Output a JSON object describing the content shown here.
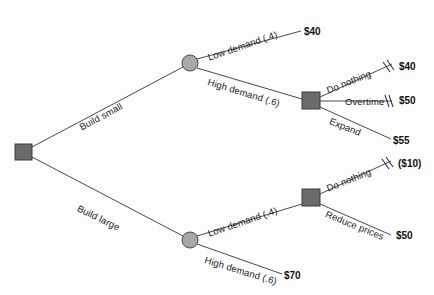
{
  "diagram": {
    "type": "decision-tree",
    "title": "",
    "colors": {
      "decision_node": "#6b6b6b",
      "chance_node": "#a8a8a8",
      "line": "#4a4a4a",
      "text": "#111111",
      "background": "#fdfdfd"
    },
    "nodes": [
      {
        "id": "root",
        "kind": "decision",
        "shape": "square",
        "x": 23,
        "y": 152
      },
      {
        "id": "chance_small",
        "kind": "chance",
        "shape": "circle",
        "x": 190,
        "y": 63
      },
      {
        "id": "decision_small_high",
        "kind": "decision",
        "shape": "square",
        "x": 311,
        "y": 101
      },
      {
        "id": "chance_large",
        "kind": "chance",
        "shape": "circle",
        "x": 190,
        "y": 240
      },
      {
        "id": "decision_large_low",
        "kind": "decision",
        "shape": "square",
        "x": 311,
        "y": 198
      }
    ],
    "branches": [
      {
        "id": "build-small",
        "label": "Build small",
        "from": "root",
        "to": "chance_small",
        "pruned": false
      },
      {
        "id": "build-large",
        "label": "Build large",
        "from": "root",
        "to": "chance_large",
        "pruned": false
      },
      {
        "id": "small-low-demand",
        "label": "Low demand (.4)",
        "from": "chance_small",
        "to": "payoff-40-a",
        "pruned": false
      },
      {
        "id": "small-high-demand",
        "label": "High demand (.6)",
        "from": "chance_small",
        "to": "decision_small_high",
        "pruned": false
      },
      {
        "id": "small-do-nothing",
        "label": "Do nothing",
        "from": "decision_small_high",
        "to": "payoff-40-b",
        "pruned": true
      },
      {
        "id": "small-overtime",
        "label": "Overtime",
        "from": "decision_small_high",
        "to": "payoff-50-a",
        "pruned": true
      },
      {
        "id": "small-expand",
        "label": "Expand",
        "from": "decision_small_high",
        "to": "payoff-55",
        "pruned": false
      },
      {
        "id": "large-low-demand",
        "label": "Low demand (.4)",
        "from": "chance_large",
        "to": "decision_large_low",
        "pruned": false
      },
      {
        "id": "large-high-demand",
        "label": "High demand (.6)",
        "from": "chance_large",
        "to": "payoff-70",
        "pruned": false
      },
      {
        "id": "large-do-nothing",
        "label": "Do nothing",
        "from": "decision_large_low",
        "to": "payoff-neg10",
        "pruned": true
      },
      {
        "id": "large-reduce-prices",
        "label": "Reduce prices",
        "from": "decision_large_low",
        "to": "payoff-50-b",
        "pruned": false
      }
    ],
    "payoffs": [
      {
        "id": "payoff-40-a",
        "value": "$40",
        "x": 304,
        "y": 26,
        "pruned": false
      },
      {
        "id": "payoff-40-b",
        "value": "$40",
        "x": 399,
        "y": 61,
        "pruned": true
      },
      {
        "id": "payoff-50-a",
        "value": "$50",
        "x": 399,
        "y": 95,
        "pruned": true
      },
      {
        "id": "payoff-55",
        "value": "$55",
        "x": 393,
        "y": 135,
        "pruned": false
      },
      {
        "id": "payoff-neg10",
        "value": "($10)",
        "x": 398,
        "y": 158,
        "pruned": true
      },
      {
        "id": "payoff-50-b",
        "value": "$50",
        "x": 396,
        "y": 230,
        "pruned": false
      },
      {
        "id": "payoff-70",
        "value": "$70",
        "x": 284,
        "y": 270,
        "pruned": false
      }
    ],
    "edge_labels": [
      {
        "id": "build-small",
        "text": "Build small",
        "x": 80,
        "y": 122,
        "rotate": -28
      },
      {
        "id": "build-large",
        "text": "Build large",
        "x": 78,
        "y": 202,
        "rotate": 26
      },
      {
        "id": "small-low-demand",
        "text": "Low demand (.4)",
        "x": 208,
        "y": 52,
        "rotate": -19
      },
      {
        "id": "small-high-demand",
        "text": "High demand (.6)",
        "x": 208,
        "y": 76,
        "rotate": 17
      },
      {
        "id": "small-do-nothing",
        "text": "Do nothing",
        "x": 327,
        "y": 85,
        "rotate": -22
      },
      {
        "id": "small-overtime",
        "text": "Overtime",
        "x": 345,
        "y": 96,
        "rotate": 0
      },
      {
        "id": "small-expand",
        "text": "Expand",
        "x": 330,
        "y": 115,
        "rotate": 22
      },
      {
        "id": "large-low-demand",
        "text": "Low demand (.4)",
        "x": 208,
        "y": 228,
        "rotate": -19
      },
      {
        "id": "large-high-demand",
        "text": "High demand (.6)",
        "x": 205,
        "y": 254,
        "rotate": 17
      },
      {
        "id": "large-do-nothing",
        "text": "Do nothing",
        "x": 327,
        "y": 183,
        "rotate": -22
      },
      {
        "id": "large-reduce-prices",
        "text": "Reduce prices",
        "x": 326,
        "y": 208,
        "rotate": 22
      }
    ]
  }
}
